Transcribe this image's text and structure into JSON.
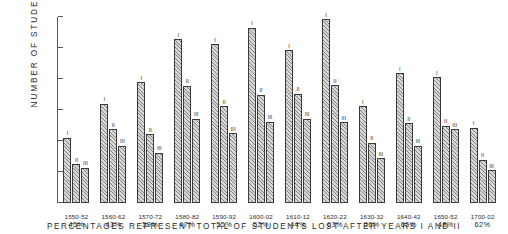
{
  "chart_data": {
    "type": "bar",
    "title": "",
    "xlabel": "PERCENTAGES REPRESENT TOTAL OF STUDENTS LOST AFTER YEARS I AND II",
    "ylabel": "NUMBER OF STUDENTS",
    "ylim": [
      0,
      600
    ],
    "yticks": [
      100,
      200,
      300,
      400,
      500,
      600
    ],
    "ytick_labels": [
      "100",
      "200",
      "300",
      "400",
      "500",
      "600"
    ],
    "grid": false,
    "legend_position": "none",
    "series_labels": [
      "I",
      "II",
      "III"
    ],
    "categories": [
      "1550-52",
      "1560-62",
      "1570-72",
      "1580-82",
      "1590-92",
      "1600-02",
      "1610-12",
      "1620-22",
      "1630-32",
      "1640-42",
      "1650-52",
      "1700-02"
    ],
    "category_percentages": [
      "45%",
      "43%",
      "59%",
      "47%",
      "55%",
      "52%",
      "44%",
      "63%",
      "56%",
      "65%",
      "48%",
      "62%"
    ],
    "series": [
      {
        "name": "I",
        "values": [
          210,
          320,
          390,
          528,
          512,
          565,
          492,
          592,
          312,
          418,
          405,
          242
        ]
      },
      {
        "name": "II",
        "values": [
          125,
          238,
          222,
          378,
          312,
          350,
          352,
          380,
          195,
          258,
          250,
          140
        ]
      },
      {
        "name": "III",
        "values": [
          113,
          185,
          162,
          272,
          225,
          262,
          272,
          260,
          145,
          185,
          238,
          105
        ]
      }
    ],
    "bar_fill": "#d8d8d8",
    "bar_edge": "#3a3a3a",
    "axis_color": "#5a5a5a",
    "background": "#ffffff"
  },
  "axis": {
    "y_title": "NUMBER OF STUDENTS"
  },
  "caption": {
    "text": "PERCENTAGES REPRESENT TOTAL OF STUDENTS LOST AFTER YEARS I AND II"
  }
}
